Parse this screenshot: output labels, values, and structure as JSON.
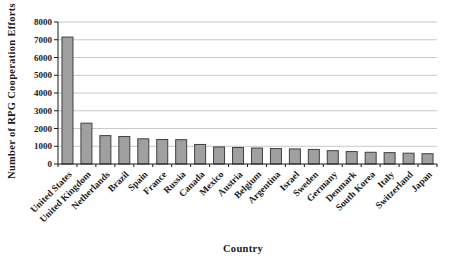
{
  "chart_data": {
    "type": "bar",
    "title": "",
    "xlabel": "Country",
    "ylabel": "Number of RPG Cooperation Efforts",
    "categories": [
      "United States",
      "United Kingdom",
      "Netherlands",
      "Brazil",
      "Spain",
      "France",
      "Russia",
      "Canada",
      "Mexico",
      "Austria",
      "Belgium",
      "Argentina",
      "Israel",
      "Sweden",
      "Germany",
      "Denmark",
      "South Korea",
      "Italy",
      "Switzerland",
      "Japan"
    ],
    "values": [
      7150,
      2300,
      1600,
      1550,
      1420,
      1380,
      1370,
      1100,
      960,
      930,
      900,
      870,
      850,
      820,
      750,
      700,
      660,
      640,
      610,
      580
    ],
    "ylim": [
      0,
      8000
    ],
    "ytick_step": 1000,
    "yticks": [
      0,
      1000,
      2000,
      3000,
      4000,
      5000,
      6000,
      7000,
      8000
    ],
    "grid": "horizontal",
    "legend": "none",
    "colors": {
      "bar_fill": "#a0a0a0",
      "bar_border": "#404040",
      "gridline": "#c8c8c8",
      "axis": "#1a1a1a",
      "background": "#ffffff"
    }
  }
}
